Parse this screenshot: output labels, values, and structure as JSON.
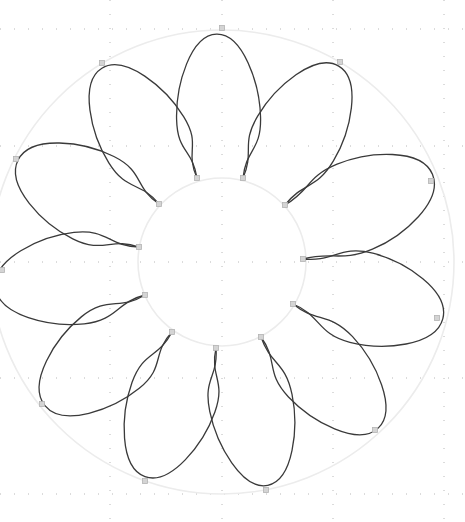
{
  "canvas": {
    "width": 465,
    "height": 522,
    "background": "#ffffff"
  },
  "grid": {
    "color": "#b8b8b8",
    "vertical_lines_x": [
      -5,
      110,
      222,
      333,
      444
    ],
    "horizontal_lines_y": [
      29,
      146,
      262,
      378,
      494
    ],
    "dot_spacing": 14
  },
  "flower": {
    "center": [
      222,
      262
    ],
    "inner_circle_radius": 84,
    "outer_circle_radius": 232,
    "guide_color": "#ececec",
    "stroke_color": "#3a3a3a",
    "petal_count": 11,
    "inner_anchor_points": [
      [
        197,
        178
      ],
      [
        243,
        178
      ],
      [
        285,
        205
      ],
      [
        303,
        259
      ],
      [
        293,
        304
      ],
      [
        261,
        337
      ],
      [
        216,
        348
      ],
      [
        172,
        332
      ],
      [
        145,
        295
      ],
      [
        139,
        247
      ],
      [
        159,
        204
      ]
    ],
    "petals": [
      {
        "name": "petal-top",
        "base": [
          [
            197,
            178
          ],
          [
            243,
            178
          ]
        ],
        "tip_anchor": [
          222,
          28
        ],
        "bulge": 42
      },
      {
        "name": "petal-upper-right",
        "base": [
          [
            243,
            178
          ],
          [
            285,
            205
          ]
        ],
        "tip_anchor": [
          340,
          62
        ],
        "bulge": 44
      },
      {
        "name": "petal-right-upper",
        "base": [
          [
            285,
            205
          ],
          [
            303,
            259
          ]
        ],
        "tip_anchor": [
          431,
          181
        ],
        "bulge": 46
      },
      {
        "name": "petal-right-lower",
        "base": [
          [
            303,
            259
          ],
          [
            293,
            304
          ]
        ],
        "tip_anchor": [
          437,
          318
        ],
        "bulge": 46
      },
      {
        "name": "petal-lower-right",
        "base": [
          [
            293,
            304
          ],
          [
            261,
            337
          ]
        ],
        "tip_anchor": [
          375,
          430
        ],
        "bulge": 44
      },
      {
        "name": "petal-bottom-right",
        "base": [
          [
            261,
            337
          ],
          [
            216,
            348
          ]
        ],
        "tip_anchor": [
          266,
          490
        ],
        "bulge": 42
      },
      {
        "name": "petal-bottom-left",
        "base": [
          [
            216,
            348
          ],
          [
            172,
            332
          ]
        ],
        "tip_anchor": [
          145,
          481
        ],
        "bulge": 44
      },
      {
        "name": "petal-lower-left",
        "base": [
          [
            172,
            332
          ],
          [
            145,
            295
          ]
        ],
        "tip_anchor": [
          42,
          404
        ],
        "bulge": 46
      },
      {
        "name": "petal-left-lower",
        "base": [
          [
            145,
            295
          ],
          [
            139,
            247
          ]
        ],
        "tip_anchor": [
          2,
          270
        ],
        "bulge": 46
      },
      {
        "name": "petal-left-upper",
        "base": [
          [
            139,
            247
          ],
          [
            159,
            204
          ]
        ],
        "tip_anchor": [
          16,
          159
        ],
        "bulge": 46
      },
      {
        "name": "petal-upper-left",
        "base": [
          [
            159,
            204
          ],
          [
            197,
            178
          ]
        ],
        "tip_anchor": [
          102,
          63
        ],
        "bulge": 44
      }
    ]
  }
}
